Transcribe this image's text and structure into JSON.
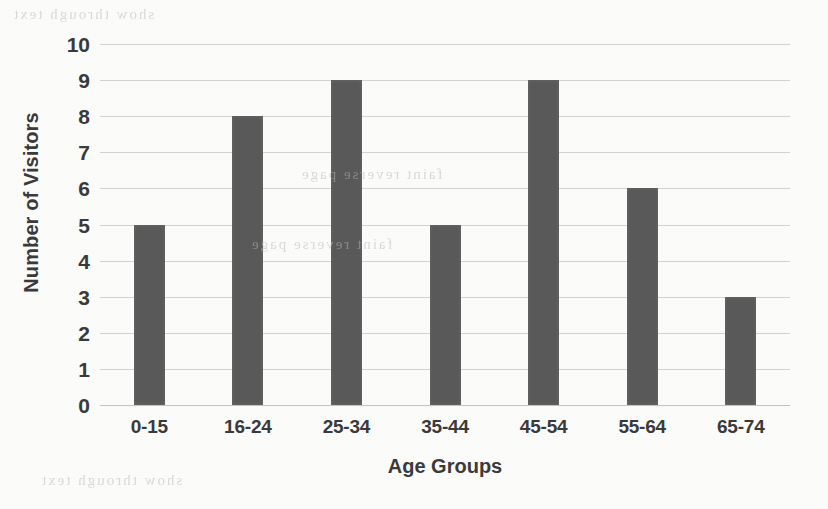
{
  "chart_data": {
    "type": "bar",
    "title": "",
    "subtitle": "",
    "categories": [
      "0-15",
      "16-24",
      "25-34",
      "35-44",
      "45-54",
      "55-64",
      "65-74"
    ],
    "values": [
      5,
      8,
      9,
      5,
      9,
      6,
      3
    ],
    "xlabel": "Age Groups",
    "ylabel": "Number of Visitors",
    "ylim": [
      0,
      10
    ],
    "ytick_step": 1,
    "yticks": [
      10,
      9,
      8,
      7,
      6,
      5,
      4,
      3,
      2,
      1,
      0
    ],
    "grid": true,
    "grid_axis": "y",
    "legend": false,
    "legend_position": "none",
    "annotations": [],
    "orientation": "vertical"
  },
  "style": {
    "bar_color": "#595959",
    "gridline_color": "#d2d2d2",
    "baseline_color": "#c3c3c3",
    "text_color": "#3a3a3a",
    "background_color": "#fbfbfa"
  },
  "artifacts": {
    "ghost_top": "show through text",
    "ghost_mid": "faint reverse page",
    "ghost_lower": "faint reverse page",
    "ghost_bottom": "show through text"
  }
}
